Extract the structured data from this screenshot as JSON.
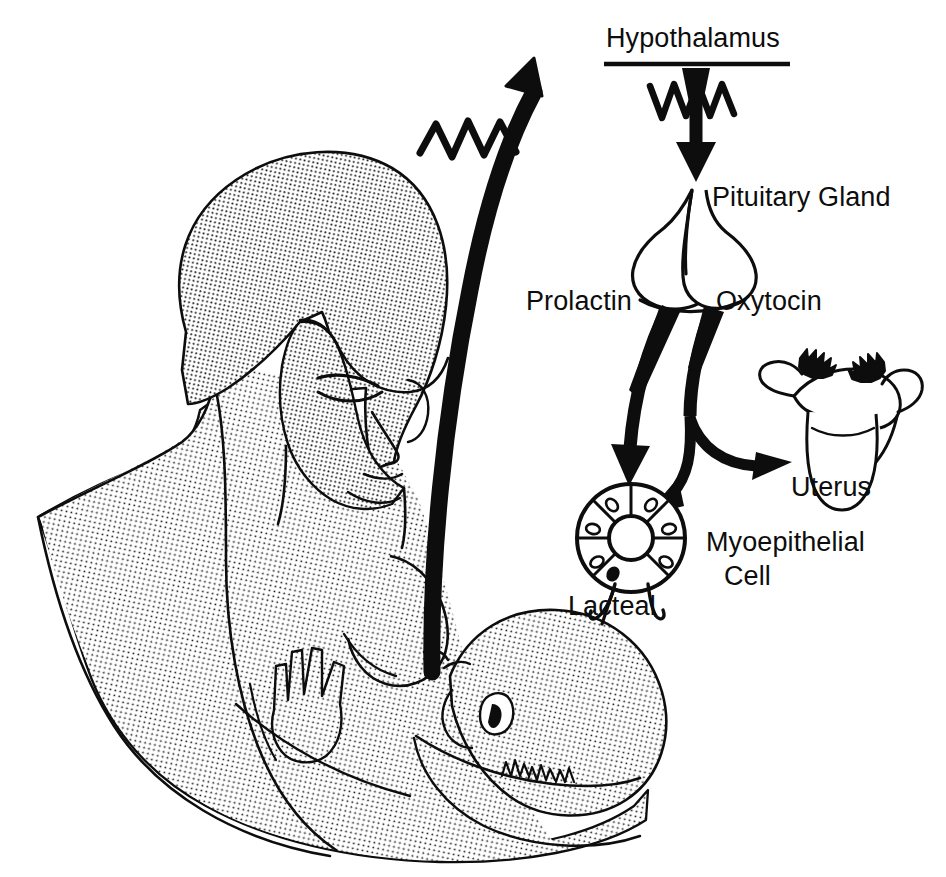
{
  "figure": {
    "background_color": "#ffffff",
    "ink_color": "#0d0d0d",
    "width": 946,
    "height": 877
  },
  "labels": {
    "hypothalamus": "Hypothalamus",
    "pituitary_gland": "Pituitary Gland",
    "prolactin": "Prolactin",
    "oxytocin": "Oxytocin",
    "uterus": "Uterus",
    "myoepithelial": "Myoepithelial",
    "cell": "Cell",
    "lacteal": "Lacteal"
  },
  "illustrations": {
    "mother_and_baby": "halftone-stippled line drawing of a mother breastfeeding an infant",
    "hypothalamus_bar": "horizontal rule beneath the Hypothalamus label",
    "nerve_impulse_zigzag_upper": "zigzag nerve impulse symbol crossing the hypothalamus-to-pituitary arrow",
    "nerve_impulse_zigzag_afferent": "zigzag nerve impulse symbol crossing the afferent nerve arrow from the breast",
    "afferent_nerve_arrow": "thick curved arrow from the nipple upward to the hypothalamus",
    "hypothalamus_to_pituitary_arrow": "short thick downward arrow",
    "pituitary_gland_shape": "two-lobed bulb with a stalk",
    "prolactin_arrow": "thick curved arrow from pituitary down to the lacteal",
    "oxytocin_arrow_to_lacteal": "thick curved arrow from pituitary down to the lacteal",
    "oxytocin_arrow_to_uterus": "thick curved arrow from pituitary right to the uterus",
    "uterus_shape": "uterus with fallopian tubes and fimbriae",
    "lacteal_shape": "alveolus ring of eight wedge-shaped myoepithelial cells with nuclei around a central lumen, with a duct",
    "lacteal_pointer": "short tick line from the Lacteal label to the duct"
  }
}
